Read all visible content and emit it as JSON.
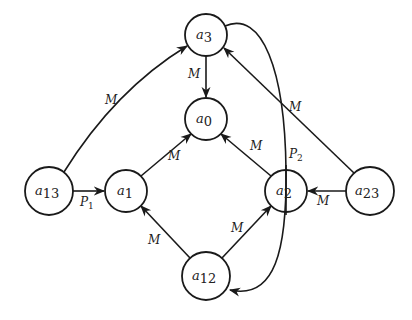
{
  "diagram": {
    "type": "directed-graph",
    "nodes": [
      {
        "id": "a3",
        "base": "a",
        "sub": "3",
        "cx": 206,
        "cy": 35,
        "r": 21
      },
      {
        "id": "a0",
        "base": "a",
        "sub": "0",
        "cx": 206,
        "cy": 119,
        "r": 21
      },
      {
        "id": "a13",
        "base": "a",
        "sub": "13",
        "cx": 49,
        "cy": 191,
        "r": 24
      },
      {
        "id": "a1",
        "base": "a",
        "sub": "1",
        "cx": 126,
        "cy": 191,
        "r": 21
      },
      {
        "id": "a2",
        "base": "a",
        "sub": "2",
        "cx": 286,
        "cy": 191,
        "r": 21
      },
      {
        "id": "a23",
        "base": "a",
        "sub": "23",
        "cx": 370,
        "cy": 191,
        "r": 24
      },
      {
        "id": "a12",
        "base": "a",
        "sub": "12",
        "cx": 206,
        "cy": 276,
        "r": 24
      }
    ],
    "edges": [
      {
        "from": "a3",
        "to": "a0",
        "label": "M",
        "sub": ""
      },
      {
        "from": "a1",
        "to": "a0",
        "label": "M",
        "sub": ""
      },
      {
        "from": "a2",
        "to": "a0",
        "label": "M",
        "sub": ""
      },
      {
        "from": "a13",
        "to": "a3",
        "label": "M",
        "sub": ""
      },
      {
        "from": "a13",
        "to": "a1",
        "label": "P",
        "sub": "1"
      },
      {
        "from": "a23",
        "to": "a3",
        "label": "M",
        "sub": ""
      },
      {
        "from": "a23",
        "to": "a2",
        "label": "M",
        "sub": ""
      },
      {
        "from": "a12",
        "to": "a1",
        "label": "M",
        "sub": ""
      },
      {
        "from": "a12",
        "to": "a2",
        "label": "M",
        "sub": ""
      },
      {
        "from": "a3",
        "to": "a12",
        "label": "P",
        "sub": "2"
      }
    ]
  },
  "labels": {
    "a3": {
      "base": "a",
      "sub": "3"
    },
    "a0": {
      "base": "a",
      "sub": "0"
    },
    "a13": {
      "base": "a",
      "sub": "13"
    },
    "a1": {
      "base": "a",
      "sub": "1"
    },
    "a2": {
      "base": "a",
      "sub": "2"
    },
    "a23": {
      "base": "a",
      "sub": "23"
    },
    "a12": {
      "base": "a",
      "sub": "12"
    },
    "e_a3_a0": {
      "text": "M"
    },
    "e_a1_a0": {
      "text": "M"
    },
    "e_a2_a0": {
      "text": "M"
    },
    "e_a13_a3": {
      "text": "M"
    },
    "e_a13_a1": {
      "text": "P",
      "sub": "1"
    },
    "e_a23_a3": {
      "text": "M"
    },
    "e_a23_a2": {
      "text": "M"
    },
    "e_a12_a1": {
      "text": "M"
    },
    "e_a12_a2": {
      "text": "M"
    },
    "e_a3_a12": {
      "text": "P",
      "sub": "2"
    }
  },
  "colors": {
    "stroke": "#1a1a1a",
    "background": "#ffffff"
  }
}
